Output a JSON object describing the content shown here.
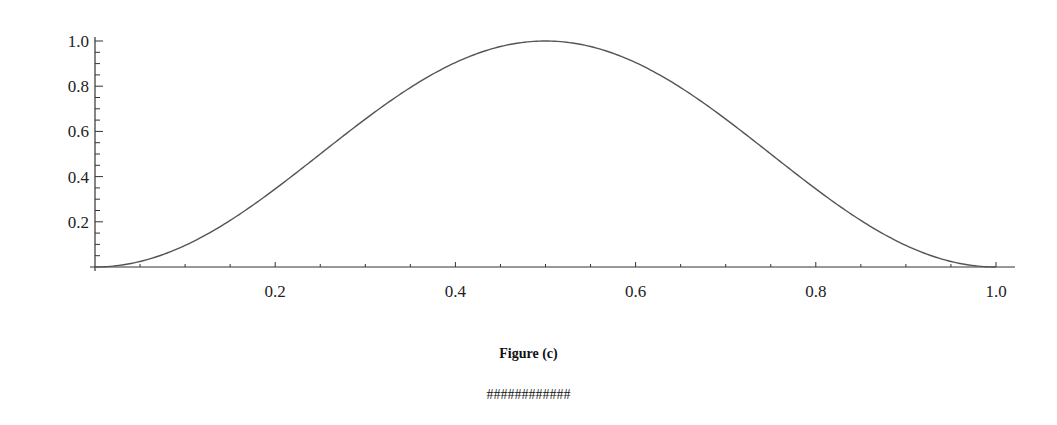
{
  "chart_data": {
    "type": "line",
    "title": "",
    "caption": "Figure (c)",
    "xlabel": "",
    "ylabel": "",
    "function": "sin^2(pi x)",
    "xlim": [
      0,
      1.0
    ],
    "ylim": [
      0,
      1.0
    ],
    "x_ticks": [
      0.2,
      0.4,
      0.6,
      0.8,
      1.0
    ],
    "x_tick_labels": [
      "0.2",
      "0.4",
      "0.6",
      "0.8",
      "1.0"
    ],
    "x_minor_step": 0.05,
    "y_ticks": [
      0.2,
      0.4,
      0.6,
      0.8,
      1.0
    ],
    "y_tick_labels": [
      "0.2",
      "0.4",
      "0.6",
      "0.8",
      "1.0"
    ],
    "y_minor_step": 0.05,
    "grid": false,
    "legend": null,
    "series": [
      {
        "name": "curve",
        "color": "#555555",
        "x": [
          0,
          0.05,
          0.1,
          0.15,
          0.2,
          0.25,
          0.3,
          0.35,
          0.4,
          0.45,
          0.5,
          0.55,
          0.6,
          0.65,
          0.7,
          0.75,
          0.8,
          0.85,
          0.9,
          0.95,
          1.0
        ],
        "y": [
          0,
          0.024,
          0.095,
          0.206,
          0.345,
          0.5,
          0.655,
          0.794,
          0.905,
          0.976,
          1.0,
          0.976,
          0.905,
          0.794,
          0.655,
          0.5,
          0.345,
          0.206,
          0.095,
          0.024,
          0
        ]
      }
    ]
  },
  "captions": {
    "figure": "Figure (c)",
    "footer": "############"
  }
}
